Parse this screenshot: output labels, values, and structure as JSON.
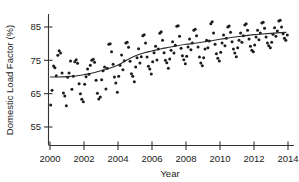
{
  "figure": {
    "name": "domestic-load-factor-scatterplot",
    "background_color": "#ffffff",
    "point_color": "#1c1c1c",
    "line_color": "#2a2a2a",
    "axis_color": "#333333"
  },
  "chart_data": {
    "type": "scatter",
    "title": "",
    "xlabel": "Year",
    "ylabel": "Domestic Load Factor (%)",
    "xlim": [
      2000,
      2014.2
    ],
    "ylim": [
      55,
      89
    ],
    "grid": false,
    "legend": "none",
    "xticks": [
      2000,
      2002,
      2004,
      2006,
      2008,
      2010,
      2012,
      2014
    ],
    "xticklabels": [
      "2000",
      "2002",
      "2004",
      "2006",
      "2008",
      "2010",
      "2012",
      "2014"
    ],
    "yticks": [
      55,
      65,
      75,
      85
    ],
    "yticklabels": [
      "55",
      "65",
      "75",
      "85"
    ],
    "series": [
      {
        "name": "Domestic Load Factor observations",
        "type": "scatter",
        "marker": "filled-circle",
        "points": [
          [
            2000.04,
            61.6
          ],
          [
            2000.12,
            66.0
          ],
          [
            2000.21,
            73.3
          ],
          [
            2000.29,
            72.8
          ],
          [
            2000.37,
            70.4
          ],
          [
            2000.46,
            76.5
          ],
          [
            2000.54,
            77.9
          ],
          [
            2000.62,
            77.2
          ],
          [
            2000.71,
            71.2
          ],
          [
            2000.79,
            65.2
          ],
          [
            2000.87,
            64.3
          ],
          [
            2000.96,
            61.4
          ],
          [
            2001.04,
            69.9
          ],
          [
            2001.12,
            71.2
          ],
          [
            2001.21,
            74.8
          ],
          [
            2001.29,
            66.3
          ],
          [
            2001.37,
            70.2
          ],
          [
            2001.46,
            74.6
          ],
          [
            2001.54,
            75.2
          ],
          [
            2001.62,
            74.1
          ],
          [
            2001.71,
            68.0
          ],
          [
            2001.79,
            65.0
          ],
          [
            2001.87,
            63.3
          ],
          [
            2001.96,
            62.6
          ],
          [
            2002.04,
            67.8
          ],
          [
            2002.12,
            70.1
          ],
          [
            2002.21,
            72.4
          ],
          [
            2002.29,
            70.8
          ],
          [
            2002.37,
            73.5
          ],
          [
            2002.46,
            75.0
          ],
          [
            2002.54,
            75.3
          ],
          [
            2002.62,
            74.4
          ],
          [
            2002.71,
            69.0
          ],
          [
            2002.79,
            65.1
          ],
          [
            2002.87,
            63.4
          ],
          [
            2002.96,
            64.0
          ],
          [
            2003.04,
            69.2
          ],
          [
            2003.12,
            71.9
          ],
          [
            2003.21,
            73.0
          ],
          [
            2003.29,
            66.4
          ],
          [
            2003.37,
            72.6
          ],
          [
            2003.46,
            79.8
          ],
          [
            2003.54,
            80.0
          ],
          [
            2003.62,
            77.6
          ],
          [
            2003.71,
            73.8
          ],
          [
            2003.79,
            70.0
          ],
          [
            2003.87,
            68.2
          ],
          [
            2003.96,
            65.4
          ],
          [
            2004.04,
            70.2
          ],
          [
            2004.12,
            73.5
          ],
          [
            2004.21,
            76.6
          ],
          [
            2004.29,
            72.2
          ],
          [
            2004.37,
            74.9
          ],
          [
            2004.46,
            80.2
          ],
          [
            2004.54,
            80.4
          ],
          [
            2004.62,
            78.9
          ],
          [
            2004.71,
            74.7
          ],
          [
            2004.79,
            71.0
          ],
          [
            2004.87,
            70.2
          ],
          [
            2004.96,
            68.6
          ],
          [
            2005.04,
            73.0
          ],
          [
            2005.12,
            75.8
          ],
          [
            2005.21,
            78.5
          ],
          [
            2005.29,
            74.2
          ],
          [
            2005.37,
            76.1
          ],
          [
            2005.46,
            82.4
          ],
          [
            2005.54,
            82.7
          ],
          [
            2005.62,
            80.2
          ],
          [
            2005.71,
            76.0
          ],
          [
            2005.79,
            73.2
          ],
          [
            2005.87,
            72.4
          ],
          [
            2005.96,
            70.9
          ],
          [
            2006.04,
            74.6
          ],
          [
            2006.12,
            77.3
          ],
          [
            2006.21,
            79.2
          ],
          [
            2006.29,
            75.1
          ],
          [
            2006.37,
            78.4
          ],
          [
            2006.46,
            83.1
          ],
          [
            2006.54,
            83.6
          ],
          [
            2006.62,
            81.0
          ],
          [
            2006.71,
            77.3
          ],
          [
            2006.79,
            75.0
          ],
          [
            2006.87,
            74.3
          ],
          [
            2006.96,
            72.6
          ],
          [
            2007.04,
            75.4
          ],
          [
            2007.12,
            78.0
          ],
          [
            2007.21,
            80.6
          ],
          [
            2007.29,
            77.2
          ],
          [
            2007.37,
            79.5
          ],
          [
            2007.46,
            85.2
          ],
          [
            2007.54,
            85.4
          ],
          [
            2007.62,
            82.2
          ],
          [
            2007.71,
            78.6
          ],
          [
            2007.79,
            76.4
          ],
          [
            2007.87,
            75.2
          ],
          [
            2007.96,
            74.0
          ],
          [
            2008.04,
            76.2
          ],
          [
            2008.12,
            79.0
          ],
          [
            2008.21,
            81.4
          ],
          [
            2008.29,
            78.2
          ],
          [
            2008.37,
            80.2
          ],
          [
            2008.46,
            84.0
          ],
          [
            2008.54,
            84.3
          ],
          [
            2008.62,
            82.4
          ],
          [
            2008.71,
            79.0
          ],
          [
            2008.79,
            76.0
          ],
          [
            2008.87,
            74.2
          ],
          [
            2008.96,
            73.4
          ],
          [
            2009.04,
            75.8
          ],
          [
            2009.12,
            78.4
          ],
          [
            2009.21,
            81.0
          ],
          [
            2009.29,
            78.8
          ],
          [
            2009.37,
            80.8
          ],
          [
            2009.46,
            86.0
          ],
          [
            2009.54,
            86.6
          ],
          [
            2009.62,
            83.2
          ],
          [
            2009.71,
            79.8
          ],
          [
            2009.79,
            77.0
          ],
          [
            2009.87,
            75.6
          ],
          [
            2009.96,
            74.8
          ],
          [
            2010.04,
            77.4
          ],
          [
            2010.12,
            80.2
          ],
          [
            2010.21,
            82.6
          ],
          [
            2010.29,
            79.4
          ],
          [
            2010.37,
            81.6
          ],
          [
            2010.46,
            85.0
          ],
          [
            2010.54,
            85.3
          ],
          [
            2010.62,
            83.4
          ],
          [
            2010.71,
            80.6
          ],
          [
            2010.79,
            78.4
          ],
          [
            2010.87,
            77.2
          ],
          [
            2010.96,
            76.1
          ],
          [
            2011.04,
            78.8
          ],
          [
            2011.12,
            81.0
          ],
          [
            2011.21,
            83.2
          ],
          [
            2011.29,
            80.4
          ],
          [
            2011.37,
            82.4
          ],
          [
            2011.46,
            85.6
          ],
          [
            2011.54,
            86.0
          ],
          [
            2011.62,
            84.0
          ],
          [
            2011.71,
            81.4
          ],
          [
            2011.79,
            79.2
          ],
          [
            2011.87,
            78.0
          ],
          [
            2011.96,
            77.6
          ],
          [
            2012.04,
            79.6
          ],
          [
            2012.12,
            82.0
          ],
          [
            2012.21,
            84.0
          ],
          [
            2012.29,
            81.2
          ],
          [
            2012.37,
            83.2
          ],
          [
            2012.46,
            86.2
          ],
          [
            2012.54,
            86.4
          ],
          [
            2012.62,
            84.6
          ],
          [
            2012.71,
            82.0
          ],
          [
            2012.79,
            80.2
          ],
          [
            2012.87,
            79.4
          ],
          [
            2012.96,
            78.8
          ],
          [
            2013.04,
            80.4
          ],
          [
            2013.12,
            82.8
          ],
          [
            2013.21,
            84.8
          ],
          [
            2013.29,
            82.2
          ],
          [
            2013.37,
            83.8
          ],
          [
            2013.46,
            86.8
          ],
          [
            2013.54,
            87.0
          ],
          [
            2013.62,
            85.0
          ],
          [
            2013.71,
            83.0
          ],
          [
            2013.79,
            81.6
          ],
          [
            2013.87,
            81.0
          ],
          [
            2013.96,
            82.6
          ]
        ]
      },
      {
        "name": "LOESS smoother",
        "type": "line",
        "points": [
          [
            2000.0,
            70.0
          ],
          [
            2000.5,
            70.0
          ],
          [
            2001.0,
            70.1
          ],
          [
            2001.5,
            70.3
          ],
          [
            2002.0,
            70.7
          ],
          [
            2002.5,
            71.2
          ],
          [
            2003.0,
            71.9
          ],
          [
            2003.5,
            72.6
          ],
          [
            2004.0,
            73.6
          ],
          [
            2004.5,
            75.0
          ],
          [
            2005.0,
            76.3
          ],
          [
            2005.5,
            77.2
          ],
          [
            2006.0,
            77.8
          ],
          [
            2006.5,
            78.4
          ],
          [
            2007.0,
            78.9
          ],
          [
            2007.5,
            79.4
          ],
          [
            2008.0,
            79.8
          ],
          [
            2008.5,
            80.1
          ],
          [
            2009.0,
            80.5
          ],
          [
            2009.5,
            80.9
          ],
          [
            2010.0,
            81.3
          ],
          [
            2010.5,
            81.7
          ],
          [
            2011.0,
            82.1
          ],
          [
            2011.5,
            82.4
          ],
          [
            2012.0,
            82.7
          ],
          [
            2012.5,
            82.9
          ],
          [
            2013.0,
            83.1
          ],
          [
            2013.5,
            83.3
          ],
          [
            2013.9,
            83.4
          ]
        ]
      }
    ]
  }
}
